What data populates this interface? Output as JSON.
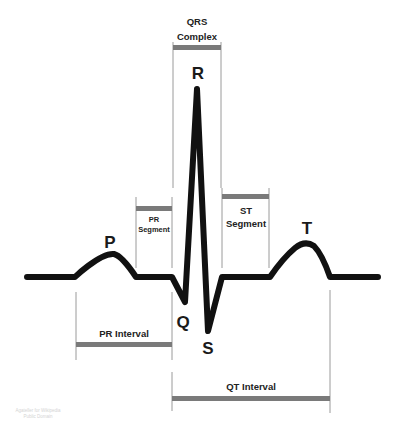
{
  "colors": {
    "trace": "#111111",
    "bracket_line": "#9a9a9a",
    "bar": "#7a7a7a",
    "text": "#222222",
    "credit": "#d4d4d4",
    "background": "#ffffff"
  },
  "waves": {
    "p": "P",
    "q": "Q",
    "r": "R",
    "s": "S",
    "t": "T"
  },
  "segments": {
    "qrs_complex": {
      "line1": "QRS",
      "line2": "Complex"
    },
    "pr_segment": {
      "line1": "PR",
      "line2": "Segment"
    },
    "st_segment": {
      "line1": "ST",
      "line2": "Segment"
    }
  },
  "intervals": {
    "pr_interval": "PR Interval",
    "qt_interval": "QT Interval"
  },
  "credit": {
    "line1": "Agateller for Wikipedia",
    "line2": "Public Domain"
  }
}
